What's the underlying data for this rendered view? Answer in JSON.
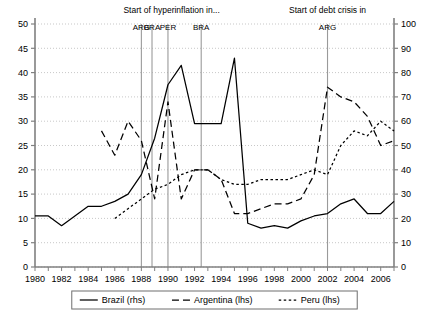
{
  "chart_data": {
    "type": "line",
    "title": "",
    "xlabel": "",
    "ylabel": "",
    "xlim": [
      1980,
      2007
    ],
    "ylim_left": [
      0,
      50
    ],
    "ylim_right": [
      0,
      100
    ],
    "grid": true,
    "legend_position": "bottom",
    "y_left_ticks": [
      0,
      5,
      10,
      15,
      20,
      25,
      30,
      35,
      40,
      45,
      50
    ],
    "y_right_ticks": [
      0,
      10,
      20,
      30,
      40,
      50,
      60,
      70,
      80,
      90,
      100
    ],
    "x_ticks": [
      1980,
      1982,
      1984,
      1986,
      1988,
      1990,
      1992,
      1994,
      1996,
      1998,
      2000,
      2002,
      2004,
      2006
    ],
    "series": [
      {
        "name": "Brazil (rhs)",
        "axis": "right",
        "style": "solid",
        "x": [
          1980,
          1981,
          1982,
          1983,
          1984,
          1985,
          1986,
          1987,
          1988,
          1989,
          1990,
          1991,
          1992,
          1993,
          1994,
          1995,
          1996,
          1997,
          1998,
          1999,
          2000,
          2001,
          2002,
          2003,
          2004,
          2005,
          2006,
          2007
        ],
        "values": [
          21,
          21,
          17,
          21,
          25,
          25,
          27,
          30,
          38,
          53,
          75,
          83,
          59,
          59,
          59,
          86,
          18,
          16,
          17,
          16,
          19,
          21,
          22,
          26,
          28,
          22,
          22,
          27
        ]
      },
      {
        "name": "Argentina (lhs)",
        "axis": "left",
        "style": "dashed",
        "x": [
          1985,
          1986,
          1987,
          1988,
          1989,
          1990,
          1991,
          1992,
          1993,
          1994,
          1995,
          1996,
          1997,
          1998,
          1999,
          2000,
          2001,
          2002,
          2003,
          2004,
          2005,
          2006,
          2007
        ],
        "values": [
          28,
          23,
          30,
          26,
          14,
          34,
          14,
          20,
          20,
          18,
          11,
          11,
          12,
          13,
          13,
          14,
          19,
          37,
          35,
          34,
          31,
          25,
          26
        ]
      },
      {
        "name": "Peru (lhs)",
        "axis": "left",
        "style": "dotted",
        "x": [
          1986,
          1987,
          1988,
          1989,
          1990,
          1991,
          1992,
          1993,
          1994,
          1995,
          1996,
          1997,
          1998,
          1999,
          2000,
          2001,
          2002,
          2003,
          2004,
          2005,
          2006,
          2007
        ],
        "values": [
          10,
          12,
          14,
          16,
          17,
          19,
          20,
          20,
          18,
          17,
          17,
          18,
          18,
          18,
          19,
          20,
          19,
          25,
          28,
          27,
          30,
          28
        ]
      }
    ],
    "annotations": [
      {
        "id": "hyperinflation",
        "title": "Start of hyperinflation in...",
        "labels": [
          "ARG",
          "BRA",
          "PER",
          "BRA"
        ],
        "lines": [
          1988.0,
          1988.8,
          1990.0,
          1992.5
        ]
      },
      {
        "id": "debt-crisis",
        "title": "Start of debt crisis in",
        "labels": [
          "ARG"
        ],
        "lines": [
          2002.0
        ]
      }
    ]
  },
  "legend": {
    "items": [
      {
        "label": "Brazil (rhs)",
        "style": "solid"
      },
      {
        "label": "Argentina (lhs)",
        "style": "dashed"
      },
      {
        "label": "Peru (lhs)",
        "style": "dotted"
      }
    ]
  },
  "colors": {
    "line": "#000000",
    "grid": "#b0b0b0",
    "axis": "#808080",
    "marker_line": "#9a9a9a",
    "background": "#ffffff"
  }
}
